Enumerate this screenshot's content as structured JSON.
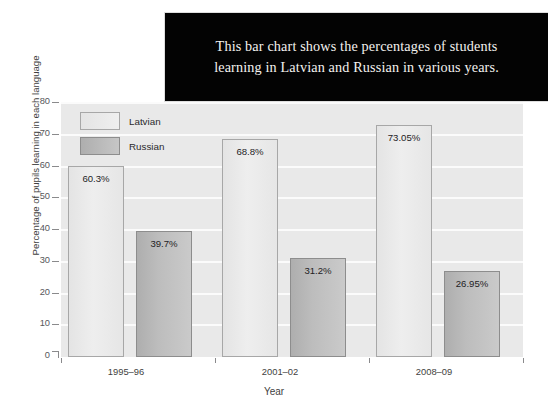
{
  "caption": {
    "text": "This bar chart shows the percentages of students learning in Latvian and Russian in various years."
  },
  "chart_data": {
    "type": "bar",
    "title": "",
    "categories": [
      "1995–96",
      "2001–02",
      "2008–09"
    ],
    "series": [
      {
        "name": "Latvian",
        "color": "#eeeeee",
        "values": [
          60.3,
          68.8,
          73.05
        ],
        "labels": [
          "60.3%",
          "68.8%",
          "73.05%"
        ]
      },
      {
        "name": "Russian",
        "color": "#bdbdbd",
        "values": [
          39.7,
          31.2,
          26.95
        ],
        "labels": [
          "39.7%",
          "31.2%",
          "26.95%"
        ]
      }
    ],
    "xlabel": "Year",
    "ylabel": "Percentage of pupils learning in each language",
    "ylim": [
      0,
      80
    ],
    "yticks": [
      0,
      10,
      20,
      30,
      40,
      50,
      60,
      70,
      80
    ],
    "ytick_labels": [
      "0",
      "10",
      "20",
      "30",
      "40",
      "50",
      "60",
      "70",
      "80"
    ],
    "grid": true,
    "legend_position": "upper-left",
    "plot_background": "#e9e9e9",
    "gridline_color": "#fbfbfb"
  },
  "legend": {
    "items": [
      {
        "label": "Latvian"
      },
      {
        "label": "Russian"
      }
    ]
  }
}
